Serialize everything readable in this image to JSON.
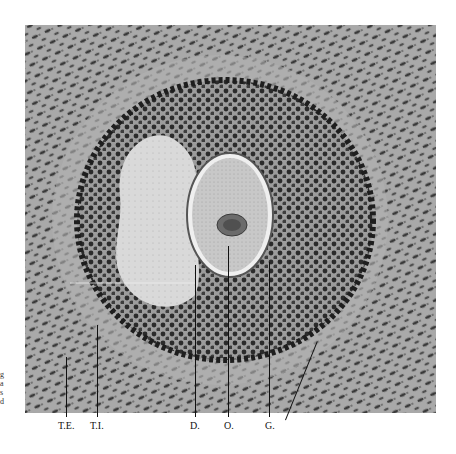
{
  "figure": {
    "type": "histological micrograph (ovarian follicle)",
    "labels": [
      {
        "id": "te",
        "text": "T.E."
      },
      {
        "id": "ti",
        "text": "T.I."
      },
      {
        "id": "d",
        "text": "D."
      },
      {
        "id": "o",
        "text": "O."
      },
      {
        "id": "g",
        "text": "G."
      }
    ],
    "edge_fragments": [
      "g",
      "a",
      "s",
      "d"
    ]
  }
}
